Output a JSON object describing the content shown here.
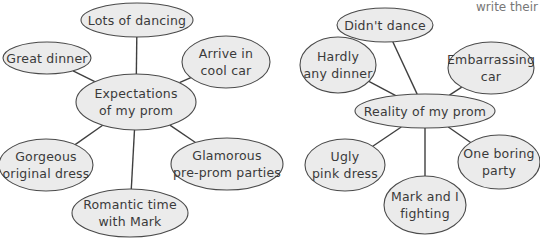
{
  "corner_text": "write their",
  "colors": {
    "fill": "#ebebeb",
    "stroke": "#4a4a4a",
    "line": "#3f3f3f",
    "text": "#3a3a3a"
  },
  "diagrams": [
    {
      "center": {
        "label": "Expectations\nof my prom",
        "cx": 136,
        "cy": 102,
        "rx": 60,
        "ry": 28
      },
      "nodes": [
        {
          "label": "Lots of dancing",
          "cx": 137,
          "cy": 20,
          "rx": 56,
          "ry": 17
        },
        {
          "label": "Great dinner",
          "cx": 47,
          "cy": 58,
          "rx": 44,
          "ry": 16
        },
        {
          "label": "Arrive in\ncool car",
          "cx": 226,
          "cy": 62,
          "rx": 44,
          "ry": 26
        },
        {
          "label": "Gorgeous\noriginal dress",
          "cx": 46,
          "cy": 165,
          "rx": 47,
          "ry": 26
        },
        {
          "label": "Glamorous\npre-prom parties",
          "cx": 227,
          "cy": 164,
          "rx": 56,
          "ry": 26
        },
        {
          "label": "Romantic time\nwith Mark",
          "cx": 130,
          "cy": 213,
          "rx": 58,
          "ry": 24
        }
      ]
    },
    {
      "center": {
        "label": "Reality of my prom",
        "cx": 425,
        "cy": 111,
        "rx": 70,
        "ry": 17
      },
      "nodes": [
        {
          "label": "Didn't dance",
          "cx": 385,
          "cy": 25,
          "rx": 48,
          "ry": 17
        },
        {
          "label": "Hardly\nany dinner",
          "cx": 338,
          "cy": 65,
          "rx": 38,
          "ry": 28
        },
        {
          "label": "Embarrassing\ncar",
          "cx": 491,
          "cy": 68,
          "rx": 43,
          "ry": 26
        },
        {
          "label": "Ugly\npink dress",
          "cx": 345,
          "cy": 165,
          "rx": 40,
          "ry": 26
        },
        {
          "label": "One boring\nparty",
          "cx": 499,
          "cy": 162,
          "rx": 41,
          "ry": 27
        },
        {
          "label": "Mark and I\nfighting",
          "cx": 425,
          "cy": 205,
          "rx": 41,
          "ry": 29
        }
      ]
    }
  ]
}
